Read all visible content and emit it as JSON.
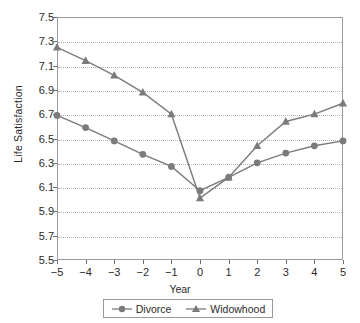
{
  "chart_data": {
    "type": "line",
    "title": "",
    "xlabel": "Year",
    "ylabel": "Life Satisfaction",
    "x": [
      -5,
      -4,
      -3,
      -2,
      -1,
      0,
      1,
      2,
      3,
      4,
      5
    ],
    "xtick_labels": [
      "−5",
      "−4",
      "−3",
      "−2",
      "−1",
      "0",
      "1",
      "2",
      "3",
      "4",
      "5"
    ],
    "ytick_labels": [
      "5.5",
      "5.7",
      "5.9",
      "6.1",
      "6.3",
      "6.5",
      "6.7",
      "6.9",
      "7.1",
      "7.3",
      "7.5"
    ],
    "yticks": [
      5.5,
      5.7,
      5.9,
      6.1,
      6.3,
      6.5,
      6.7,
      6.9,
      7.1,
      7.3,
      7.5
    ],
    "xlim": [
      -5,
      5
    ],
    "ylim": [
      5.5,
      7.5
    ],
    "grid": "horizontal-dotted",
    "legend_position": "bottom-center",
    "series": [
      {
        "name": "Divorce",
        "marker": "circle",
        "color": "#7b7b7b",
        "values": [
          6.69,
          6.59,
          6.48,
          6.37,
          6.27,
          6.07,
          6.18,
          6.3,
          6.38,
          6.44,
          6.48
        ]
      },
      {
        "name": "Widowhood",
        "marker": "triangle",
        "color": "#7b7b7b",
        "values": [
          7.25,
          7.14,
          7.02,
          6.88,
          6.7,
          6.01,
          6.18,
          6.44,
          6.64,
          6.7,
          6.79
        ]
      }
    ]
  },
  "axes": {
    "y_title": "Life Satisfaction",
    "x_title": "Year"
  },
  "colors": {
    "series": "#7b7b7b",
    "frame": "#9a9a9a",
    "grid": "#b5b5b5",
    "text": "#2b2b2b"
  }
}
